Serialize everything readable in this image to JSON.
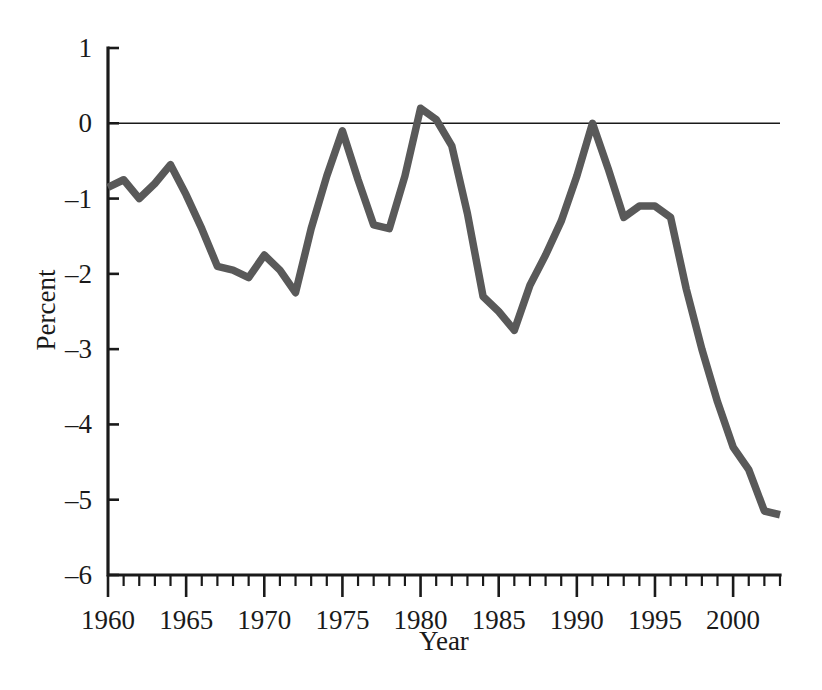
{
  "chart_data": {
    "type": "line",
    "title": "",
    "subtitle": "",
    "xlabel": "Year",
    "ylabel": "Percent",
    "xlim": [
      1960,
      2003
    ],
    "ylim": [
      -6,
      1
    ],
    "grid": false,
    "legend": false,
    "legend_position": "none",
    "line_color": "#595959",
    "axis_color": "#1a1a1a",
    "x_ticks_major": [
      1960,
      1965,
      1970,
      1975,
      1980,
      1985,
      1990,
      1995,
      2000
    ],
    "x_tick_labels": [
      "1960",
      "1965",
      "1970",
      "1975",
      "1980",
      "1985",
      "1990",
      "1995",
      "2000"
    ],
    "x_tick_minor_step": 1,
    "y_ticks": [
      1,
      0,
      -1,
      -2,
      -3,
      -4,
      -5,
      -6
    ],
    "y_tick_labels": [
      "1",
      "0",
      "–1",
      "–2",
      "–3",
      "–4",
      "–5",
      "–6"
    ],
    "zero_reference_line": 0,
    "series": [
      {
        "name": "Percent",
        "color": "#595959",
        "x": [
          1960,
          1961,
          1962,
          1963,
          1964,
          1965,
          1966,
          1967,
          1968,
          1969,
          1970,
          1971,
          1972,
          1973,
          1974,
          1975,
          1976,
          1977,
          1978,
          1979,
          1980,
          1981,
          1982,
          1983,
          1984,
          1985,
          1986,
          1987,
          1988,
          1989,
          1990,
          1991,
          1992,
          1993,
          1994,
          1995,
          1996,
          1997,
          1998,
          1999,
          2000,
          2001,
          2002,
          2003
        ],
        "values": [
          -0.85,
          -0.75,
          -1.0,
          -0.8,
          -0.55,
          -0.95,
          -1.4,
          -1.9,
          -1.95,
          -2.05,
          -1.75,
          -1.95,
          -2.25,
          -1.4,
          -0.7,
          -0.1,
          -0.75,
          -1.35,
          -1.4,
          -0.7,
          0.2,
          0.05,
          -0.3,
          -1.2,
          -2.3,
          -2.5,
          -2.75,
          -2.15,
          -1.75,
          -1.3,
          -0.7,
          0.0,
          -0.6,
          -1.25,
          -1.1,
          -1.1,
          -1.25,
          -2.2,
          -3.0,
          -3.7,
          -4.3,
          -4.6,
          -5.15,
          -5.2
        ]
      }
    ],
    "annotations": []
  },
  "axis_titles": {
    "x": "Year",
    "y": "Percent"
  }
}
